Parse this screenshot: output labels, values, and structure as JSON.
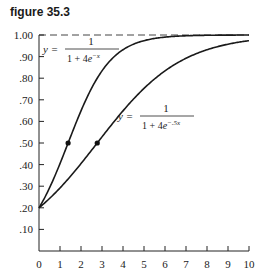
{
  "figure_title": "figure 35.3",
  "chart_data": {
    "type": "line",
    "title": "figure 35.3",
    "xlabel": "",
    "ylabel": "",
    "xlim": [
      0,
      10
    ],
    "ylim": [
      0,
      1.0
    ],
    "x_ticks": [
      "0",
      "1",
      "2",
      "3",
      "4",
      "5",
      "6",
      "7",
      "8",
      "9",
      "10"
    ],
    "y_ticks": [
      ".10",
      ".20",
      ".30",
      ".40",
      ".50",
      ".60",
      ".70",
      ".80",
      ".90",
      "1.00"
    ],
    "grid": false,
    "asymptote": {
      "y": 1.0,
      "style": "dashed"
    },
    "series": [
      {
        "name": "y = 1 / (1 + 4e^-x)",
        "label_numerator": "1",
        "label_denominator": "1 + 4e",
        "label_exponent": "−x",
        "x": [
          0,
          0.5,
          1,
          1.386,
          2,
          3,
          4,
          5,
          6,
          7,
          8,
          9,
          10
        ],
        "values": [
          0.2,
          0.29,
          0.4,
          0.5,
          0.65,
          0.83,
          0.93,
          0.97,
          0.99,
          1.0,
          1.0,
          1.0,
          1.0
        ],
        "marker": {
          "x": 1.386,
          "y": 0.5
        }
      },
      {
        "name": "y = 1 / (1 + 4e^-.5x)",
        "label_numerator": "1",
        "label_denominator": "1 + 4e",
        "label_exponent": "−.5x",
        "x": [
          0,
          1,
          2,
          2.773,
          3,
          4,
          5,
          6,
          7,
          8,
          9,
          10
        ],
        "values": [
          0.2,
          0.29,
          0.4,
          0.5,
          0.53,
          0.65,
          0.75,
          0.83,
          0.89,
          0.93,
          0.95,
          0.97
        ],
        "marker": {
          "x": 2.773,
          "y": 0.5
        }
      }
    ]
  }
}
